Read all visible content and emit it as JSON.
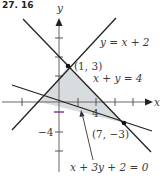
{
  "header": {
    "problem_label": "27. 16"
  },
  "axes": {
    "x_label": "x",
    "y_label": "y",
    "x_tick_label": "4",
    "y_tick_label": "−4",
    "x_ticks": [
      -6,
      -2,
      2,
      4,
      6,
      8
    ],
    "y_ticks": [
      2,
      4,
      -2,
      -4,
      -6
    ]
  },
  "lines": [
    {
      "id": "line-y-eq-x-plus-2",
      "label": "y = x + 2",
      "color": "#222222"
    },
    {
      "id": "line-x-plus-y-eq-4",
      "label": "x + y = 4",
      "color": "#222222"
    },
    {
      "id": "line-x-plus-3y-plus-2-eq-0",
      "label": "x + 3y + 2 = 0",
      "color": "#222222"
    }
  ],
  "vertices": [
    {
      "label": "(1, 3)",
      "x": 1,
      "y": 3
    },
    {
      "label": "(7, −3)",
      "x": 7,
      "y": -3
    },
    {
      "label": "",
      "x": -2,
      "y": 0
    }
  ],
  "region": {
    "fill": "#d9dcdf",
    "description": "feasible triangle"
  },
  "accent_tick_color": "#8a3a8a"
}
